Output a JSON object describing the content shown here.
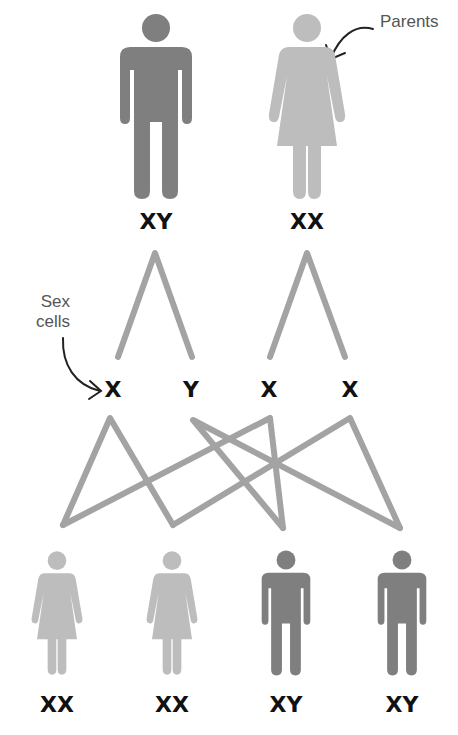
{
  "colors": {
    "male": "#7f7f7f",
    "female": "#bdbdbd",
    "lines": "#a3a3a3",
    "text": "#111111",
    "annotation": "#555555",
    "arrow": "#222222"
  },
  "annotations": {
    "parents": "Parents",
    "sex_cells_line1": "Sex",
    "sex_cells_line2": "cells"
  },
  "parents": [
    {
      "sex": "male",
      "icon": "man-icon",
      "genotype": "XY"
    },
    {
      "sex": "female",
      "icon": "woman-icon",
      "genotype": "XX"
    }
  ],
  "sex_cells": [
    {
      "from": "father",
      "chromosome": "X"
    },
    {
      "from": "father",
      "chromosome": "Y"
    },
    {
      "from": "mother",
      "chromosome": "X"
    },
    {
      "from": "mother",
      "chromosome": "X"
    }
  ],
  "offspring": [
    {
      "sex": "female",
      "icon": "woman-icon",
      "genotype": "XX"
    },
    {
      "sex": "female",
      "icon": "woman-icon",
      "genotype": "XX"
    },
    {
      "sex": "male",
      "icon": "man-icon",
      "genotype": "XY"
    },
    {
      "sex": "male",
      "icon": "man-icon",
      "genotype": "XY"
    }
  ]
}
